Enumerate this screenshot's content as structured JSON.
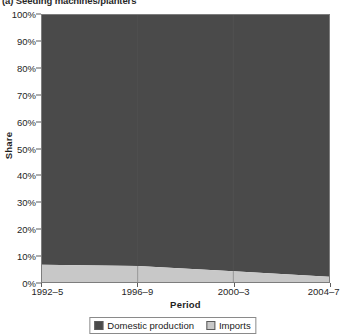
{
  "figure": {
    "title": "(a) Seeding machines/planters"
  },
  "axes": {
    "y_title": "Share",
    "x_title": "Period",
    "y_ticks": [
      "0%",
      "10%",
      "20%",
      "30%",
      "40%",
      "50%",
      "60%",
      "70%",
      "80%",
      "90%",
      "100%"
    ],
    "x_ticks": [
      "1992–5",
      "1996–9",
      "2000–3",
      "2004–7"
    ]
  },
  "legend": {
    "position": "bottom-center",
    "items": [
      {
        "label": "Domestic production",
        "color": "#4a4a4a"
      },
      {
        "label": "Imports",
        "color": "#c8c8c8"
      }
    ]
  },
  "colors": {
    "domestic_production": "#4a4a4a",
    "imports": "#c8c8c8",
    "axis": "#5e5e5e",
    "plot_border": "#7d7d7d",
    "text": "#1f1f1f",
    "background": "#ffffff"
  },
  "chart_data": {
    "type": "area",
    "stacked": true,
    "normalized": true,
    "title": "(a) Seeding machines/planters",
    "xlabel": "Period",
    "ylabel": "Share",
    "ylim": [
      0,
      100
    ],
    "yticks": [
      0,
      10,
      20,
      30,
      40,
      50,
      60,
      70,
      80,
      90,
      100
    ],
    "ytick_labels": [
      "0%",
      "10%",
      "20%",
      "30%",
      "40%",
      "50%",
      "60%",
      "70%",
      "80%",
      "90%",
      "100%"
    ],
    "grid": false,
    "legend_position": "bottom-center",
    "categories": [
      "1992–5",
      "1996–9",
      "2000–3",
      "2004–7"
    ],
    "x": [
      1992,
      1996,
      2000,
      2004
    ],
    "series": [
      {
        "name": "Imports",
        "color": "#c8c8c8",
        "values": [
          6.5,
          6.0,
          4.0,
          2.0
        ]
      },
      {
        "name": "Domestic production",
        "color": "#4a4a4a",
        "values": [
          93.5,
          94.0,
          96.0,
          98.0
        ]
      }
    ],
    "units": "percent share"
  }
}
